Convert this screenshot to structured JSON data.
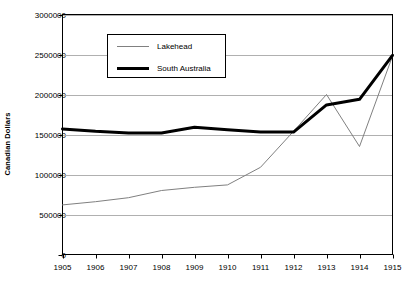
{
  "chart_data": {
    "type": "line",
    "title": "",
    "xlabel": "",
    "ylabel": "Canadian Dollars",
    "x": [
      1905,
      1906,
      1907,
      1908,
      1909,
      1910,
      1911,
      1912,
      1913,
      1914,
      1915
    ],
    "xtick_labels": [
      "1905",
      "1906",
      "1907",
      "1908",
      "1909",
      "1910",
      "1911",
      "1912",
      "1913",
      "1914",
      "1915"
    ],
    "ylim": [
      0,
      3000000
    ],
    "ytick_values": [
      0,
      500000,
      1000000,
      1500000,
      2000000,
      2500000,
      3000000
    ],
    "ytick_labels": [
      "0",
      "500000",
      "1000000",
      "1500000",
      "2000000",
      "2500000",
      "3000000"
    ],
    "grid": true,
    "grid_axis": "y",
    "legend_position": "upper-left-inside",
    "series": [
      {
        "name": "Lakehead",
        "color": "#808080",
        "line_width": 1,
        "values": [
          620000,
          660000,
          710000,
          800000,
          840000,
          870000,
          1090000,
          1540000,
          2000000,
          1350000,
          2480000
        ]
      },
      {
        "name": "South Australia",
        "color": "#000000",
        "line_width": 3,
        "values": [
          1570000,
          1540000,
          1520000,
          1520000,
          1590000,
          1560000,
          1530000,
          1530000,
          1870000,
          1940000,
          2490000
        ]
      }
    ]
  },
  "legend": {
    "items": [
      {
        "label": "Lakehead",
        "swatch": "thin-gray-line"
      },
      {
        "label": "South Australia",
        "swatch": "thick-black-line"
      }
    ]
  },
  "axes": {
    "y_title": "Canadian Dollars"
  }
}
